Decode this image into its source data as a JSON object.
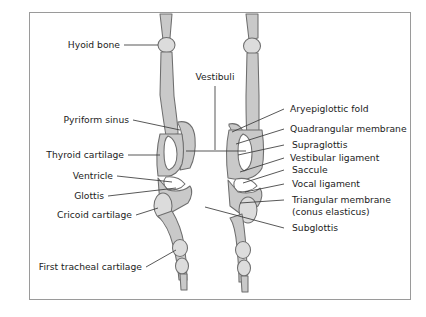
{
  "figure": {
    "frame_color": "#9a9a9a",
    "background": "#ffffff",
    "organ_fill_mid": "#c9c9c9",
    "organ_fill_light": "#dcdcdc",
    "organ_outline": "#6e6e6e",
    "leader_color": "#3a3a3a",
    "text_color": "#1c1c1c"
  },
  "labels": {
    "left": [
      {
        "id": "hyoid-bone",
        "text": "Hyoid bone"
      },
      {
        "id": "pyriform-sinus",
        "text": "Pyriform sinus"
      },
      {
        "id": "thyroid-cartilage",
        "text": "Thyroid cartilage"
      },
      {
        "id": "ventricle",
        "text": "Ventricle"
      },
      {
        "id": "glottis",
        "text": "Glottis"
      },
      {
        "id": "cricoid-cartilage",
        "text": "Cricoid cartilage"
      },
      {
        "id": "first-tracheal-cartilage",
        "text": "First tracheal cartilage"
      }
    ],
    "center": [
      {
        "id": "vestibuli",
        "text": "Vestibuli"
      }
    ],
    "right": [
      {
        "id": "aryepiglottic-fold",
        "text": "Aryepiglottic fold"
      },
      {
        "id": "quadrangular-membrane",
        "text": "Quadrangular membrane"
      },
      {
        "id": "supraglottis",
        "text": "Supraglottis"
      },
      {
        "id": "vestibular-ligament",
        "text": "Vestibular ligament"
      },
      {
        "id": "saccule",
        "text": "Saccule"
      },
      {
        "id": "vocal-ligament",
        "text": "Vocal ligament"
      },
      {
        "id": "triangular-membrane",
        "text": "Triangular membrane"
      },
      {
        "id": "conus-elasticus",
        "text": "(conus elasticus)"
      },
      {
        "id": "subglottis",
        "text": "Subglottis"
      }
    ]
  }
}
